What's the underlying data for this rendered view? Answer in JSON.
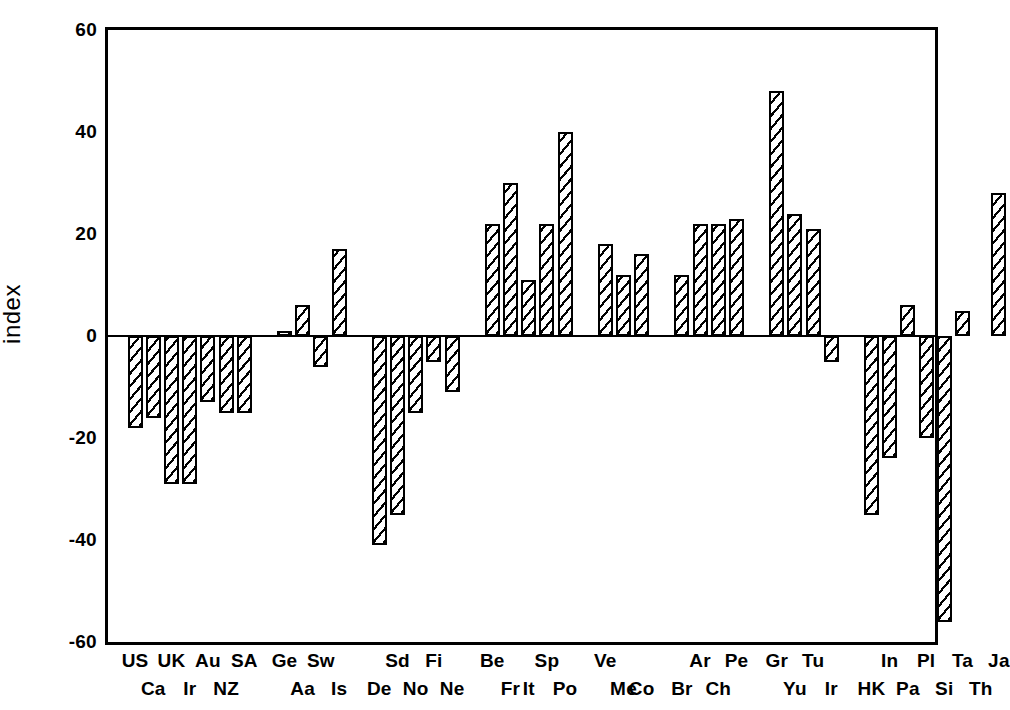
{
  "chart_data": {
    "type": "bar",
    "title": "",
    "xlabel": "",
    "ylabel": "index",
    "ylim": [
      -60,
      60
    ],
    "yticks": [
      60,
      40,
      20,
      0,
      -20,
      -40,
      -60
    ],
    "ytick_labels": [
      "60",
      "40",
      "20",
      "0",
      "-20",
      "-40",
      "-60"
    ],
    "grid": false,
    "legend": null,
    "orientation": "vertical",
    "bar_fill": "diagonal-hatch",
    "bar_edge_color": "#000000",
    "bar_face_color": "#ffffff",
    "background": "#ffffff",
    "label_rows": 2,
    "note": "Labels are staggered over two rows; row 0 = upper row, row 1 = lower row. Groups are separated by gaps.",
    "groups": [
      {
        "index": 0,
        "categories": [
          "US",
          "Ca",
          "UK",
          "Ir",
          "Au",
          "NZ",
          "SA"
        ],
        "values": [
          -18,
          -16,
          -29,
          -29,
          -13,
          -15,
          -15
        ],
        "label_rows": [
          0,
          1,
          0,
          1,
          0,
          1,
          0
        ]
      },
      {
        "index": 1,
        "categories": [
          "Ge",
          "Aa",
          "Sw",
          "Is"
        ],
        "values": [
          1,
          6,
          -6,
          17
        ],
        "label_rows": [
          0,
          1,
          0,
          1
        ]
      },
      {
        "index": 2,
        "categories": [
          "De",
          "Sd",
          "No",
          "Fi",
          "Ne"
        ],
        "values": [
          -41,
          -35,
          -15,
          -5,
          -11
        ],
        "label_rows": [
          1,
          0,
          1,
          0,
          1
        ]
      },
      {
        "index": 3,
        "categories": [
          "Be",
          "Fr",
          "It",
          "Sp",
          "Po"
        ],
        "values": [
          22,
          30,
          11,
          22,
          40
        ],
        "label_rows": [
          0,
          1,
          1,
          0,
          1
        ]
      },
      {
        "index": 4,
        "categories": [
          "Ve",
          "Me",
          "Co"
        ],
        "values": [
          18,
          12,
          16
        ],
        "label_rows": [
          0,
          1,
          1
        ]
      },
      {
        "index": 5,
        "categories": [
          "Br",
          "Ar",
          "Ch",
          "Pe"
        ],
        "values": [
          12,
          22,
          22,
          23
        ],
        "label_rows": [
          1,
          0,
          1,
          0
        ]
      },
      {
        "index": 6,
        "categories": [
          "Gr",
          "Yu",
          "Tu",
          "Ir"
        ],
        "values": [
          48,
          24,
          21,
          -5
        ],
        "label_rows": [
          0,
          1,
          0,
          1
        ]
      },
      {
        "index": 7,
        "categories": [
          "HK",
          "In",
          "Pa",
          "Pl",
          "Si",
          "Ta",
          "Th",
          "Ja"
        ],
        "values": [
          -35,
          -24,
          6,
          -20,
          -56,
          5,
          0,
          28
        ],
        "label_rows": [
          1,
          0,
          1,
          0,
          1,
          0,
          1,
          0
        ]
      }
    ],
    "categories_flat": [
      "US",
      "Ca",
      "UK",
      "Ir",
      "Au",
      "NZ",
      "SA",
      "Ge",
      "Aa",
      "Sw",
      "Is",
      "De",
      "Sd",
      "No",
      "Fi",
      "Ne",
      "Be",
      "Fr",
      "It",
      "Sp",
      "Po",
      "Ve",
      "Me",
      "Co",
      "Br",
      "Ar",
      "Ch",
      "Pe",
      "Gr",
      "Yu",
      "Tu",
      "Ir",
      "HK",
      "In",
      "Pa",
      "Pl",
      "Si",
      "Ta",
      "Th",
      "Ja"
    ],
    "values_flat": [
      -18,
      -16,
      -29,
      -29,
      -13,
      -15,
      -15,
      1,
      6,
      -6,
      17,
      -41,
      -35,
      -15,
      -5,
      -11,
      22,
      30,
      11,
      22,
      40,
      18,
      12,
      16,
      12,
      22,
      22,
      23,
      48,
      24,
      21,
      -5,
      -35,
      -24,
      6,
      -20,
      -56,
      5,
      0,
      28
    ]
  }
}
